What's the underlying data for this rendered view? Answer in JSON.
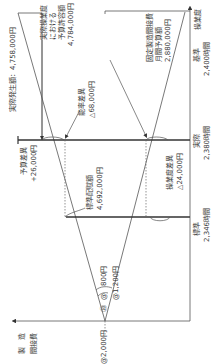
{
  "diagram": {
    "orientation": "rotated-90",
    "axes": {
      "cost_axis_label_line1": "製　造",
      "cost_axis_label_line2": "間接費",
      "activity_axis_label": "操業度"
    },
    "rates": {
      "total_rate": "@2,000円",
      "variable_rate": "@　800円",
      "fixed_rate": "@1,200円",
      "variable_marker": "⑳",
      "fixed_marker": "⑳"
    },
    "activity_levels": {
      "standard_label": "標準",
      "standard_hours": "2,346時間",
      "actual_label": "実際",
      "actual_hours": "2,380時間",
      "base_label": "基準",
      "base_hours": "2,400時間"
    },
    "amounts": {
      "actual_cost": "実際発生額：4,758,000円",
      "budget_at_actual_line1": "実際操業度",
      "budget_at_actual_line2": "における",
      "budget_at_actual_line3": "予算許容額",
      "budget_at_actual_value": "4,784,000円",
      "fixed_budget_line1": "固定製造間接費",
      "fixed_budget_line2": "月間予算額",
      "fixed_budget_value": "2,880,000円",
      "standard_allocation_label": "標準配賦額",
      "standard_allocation_value": "4,692,000円"
    },
    "variances": {
      "budget_label": "予算差異",
      "budget_value": "+26,000円",
      "efficiency_label": "能率差異",
      "efficiency_value": "△68,000円",
      "volume_label": "操業度差異",
      "volume_value": "△24,000円"
    },
    "colors": {
      "line": "#555555",
      "thick_line": "#333333",
      "text": "#3a3a3a"
    }
  }
}
